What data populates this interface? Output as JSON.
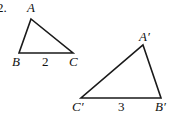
{
  "problem_number": "2.",
  "triangle_small": {
    "vertices": {
      "A": {
        "label": "A",
        "x": 31,
        "y": 19
      },
      "B": {
        "label": "B",
        "x": 19,
        "y": 53
      },
      "C": {
        "label": "C",
        "x": 73,
        "y": 53
      }
    },
    "side_label": "2"
  },
  "triangle_large": {
    "vertices": {
      "A": {
        "label": "A′",
        "x": 143,
        "y": 45
      },
      "B": {
        "label": "B′",
        "x": 161,
        "y": 98
      },
      "C": {
        "label": "C′",
        "x": 81,
        "y": 98
      }
    },
    "side_label": "3"
  }
}
